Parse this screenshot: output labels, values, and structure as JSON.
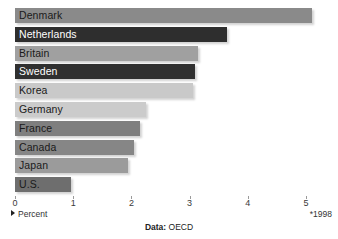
{
  "chart_data": {
    "type": "bar",
    "orientation": "horizontal",
    "title": "",
    "subtitle": "",
    "xlabel": "Percent",
    "ylabel": "",
    "xlim": [
      0,
      5.2
    ],
    "grid": false,
    "legend": null,
    "categories": [
      "Denmark",
      "Netherlands",
      "Britain",
      "Sweden",
      "Korea",
      "Germany",
      "France",
      "Canada",
      "Japan",
      "U.S."
    ],
    "values": [
      5.1,
      3.65,
      3.15,
      3.1,
      3.05,
      2.25,
      2.15,
      2.05,
      1.95,
      0.97
    ],
    "xticks": [
      0,
      1,
      2,
      3,
      4,
      5
    ],
    "xticklabels": [
      "0",
      "1",
      "2",
      "3",
      "4",
      "5"
    ],
    "bars": [
      {
        "label": "Denmark",
        "value": 5.1,
        "color": "#8a8a8a",
        "label_color": "light"
      },
      {
        "label": "Netherlands",
        "value": 3.65,
        "color": "#2e2e2e",
        "label_color": "dark"
      },
      {
        "label": "Britain",
        "value": 3.15,
        "color": "#a0a0a0",
        "label_color": "light"
      },
      {
        "label": "Sweden",
        "value": 3.1,
        "color": "#303030",
        "label_color": "dark"
      },
      {
        "label": "Korea",
        "value": 3.05,
        "color": "#c9c9c9",
        "label_color": "light"
      },
      {
        "label": "Germany",
        "value": 2.25,
        "color": "#cbcbcb",
        "label_color": "light"
      },
      {
        "label": "France",
        "value": 2.15,
        "color": "#7f7f7f",
        "label_color": "light"
      },
      {
        "label": "Canada",
        "value": 2.05,
        "color": "#868686",
        "label_color": "light"
      },
      {
        "label": "Japan",
        "value": 1.95,
        "color": "#9b9b9b",
        "label_color": "light"
      },
      {
        "label": "U.S.",
        "value": 0.97,
        "color": "#6e6e6e",
        "label_color": "light"
      }
    ],
    "annotations": {
      "percent_note": "Percent",
      "year_note": "*1998",
      "source_key": "Data:",
      "source_value": " OECD"
    }
  },
  "axis": {
    "tick_0": "0",
    "tick_1": "1",
    "tick_2": "2",
    "tick_3": "3",
    "tick_4": "4",
    "tick_5": "5"
  },
  "footer": {
    "percent_label": "Percent",
    "year_label": "*1998",
    "source_key": "Data:",
    "source_value": " OECD"
  },
  "colors": {
    "background": "#ffffff",
    "tick": "#9a9a9a",
    "text": "#333333",
    "bar_dark": "#2e2e2e",
    "bar_mid": "#8a8a8a",
    "bar_light": "#c9c9c9"
  }
}
